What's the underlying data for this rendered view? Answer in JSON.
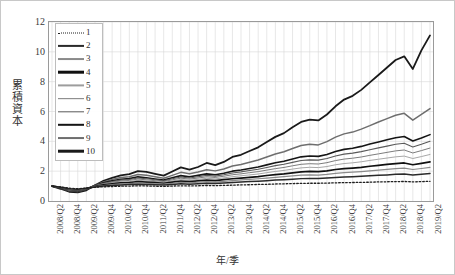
{
  "chart_data": {
    "type": "line",
    "title": "",
    "xlabel": "年/季",
    "ylabel": "累積資本",
    "ylim": [
      0,
      12
    ],
    "yticks": [
      0,
      2,
      4,
      6,
      8,
      10,
      12
    ],
    "grid": true,
    "legend_position": "top-left",
    "x_tick_labels": [
      "2008/Q2",
      "2008/Q4",
      "2009/Q2",
      "2009/Q4",
      "2010/Q2",
      "2010/Q4",
      "2011/Q2",
      "2011/Q4",
      "2012/Q2",
      "2012/Q4",
      "2013/Q2",
      "2013/Q4",
      "2014/Q2",
      "2014/Q4",
      "2015/Q2",
      "2015/Q4",
      "2016/Q2",
      "2016/Q4",
      "2017/Q2",
      "2017/Q4",
      "2018/Q2",
      "2018/Q4",
      "2019/Q2"
    ],
    "x": [
      "2008/Q2",
      "2008/Q3",
      "2008/Q4",
      "2009/Q1",
      "2009/Q2",
      "2009/Q3",
      "2009/Q4",
      "2010/Q1",
      "2010/Q2",
      "2010/Q3",
      "2010/Q4",
      "2011/Q1",
      "2011/Q2",
      "2011/Q3",
      "2011/Q4",
      "2012/Q1",
      "2012/Q2",
      "2012/Q3",
      "2012/Q4",
      "2013/Q1",
      "2013/Q2",
      "2013/Q3",
      "2013/Q4",
      "2014/Q1",
      "2014/Q2",
      "2014/Q3",
      "2014/Q4",
      "2015/Q1",
      "2015/Q2",
      "2015/Q3",
      "2015/Q4",
      "2016/Q1",
      "2016/Q2",
      "2016/Q3",
      "2016/Q4",
      "2017/Q1",
      "2017/Q2",
      "2017/Q3",
      "2017/Q4",
      "2018/Q1",
      "2018/Q2",
      "2018/Q3",
      "2018/Q4",
      "2019/Q1",
      "2019/Q2"
    ],
    "series": [
      {
        "name": "10",
        "style": "solid",
        "width": 1.8,
        "color": "#1a1a1a",
        "values": [
          1.0,
          0.82,
          0.62,
          0.58,
          0.72,
          1.05,
          1.35,
          1.55,
          1.72,
          1.8,
          2.0,
          1.95,
          1.82,
          1.7,
          1.98,
          2.25,
          2.1,
          2.28,
          2.55,
          2.4,
          2.62,
          2.95,
          3.1,
          3.35,
          3.6,
          3.95,
          4.3,
          4.55,
          4.95,
          5.3,
          5.45,
          5.4,
          5.8,
          6.35,
          6.8,
          7.05,
          7.45,
          7.95,
          8.45,
          8.95,
          9.45,
          9.7,
          8.85,
          10.1,
          11.1
        ]
      },
      {
        "name": "9",
        "style": "solid",
        "width": 1.5,
        "color": "#6e6e6e",
        "values": [
          1.0,
          0.85,
          0.68,
          0.64,
          0.78,
          1.05,
          1.28,
          1.45,
          1.58,
          1.62,
          1.78,
          1.72,
          1.62,
          1.52,
          1.72,
          1.92,
          1.82,
          1.95,
          2.1,
          2.02,
          2.15,
          2.35,
          2.45,
          2.6,
          2.75,
          2.95,
          3.15,
          3.3,
          3.52,
          3.72,
          3.8,
          3.76,
          3.98,
          4.28,
          4.5,
          4.62,
          4.82,
          5.05,
          5.3,
          5.52,
          5.75,
          5.88,
          5.42,
          5.8,
          6.2
        ]
      },
      {
        "name": "8",
        "style": "solid",
        "width": 1.6,
        "color": "#151515",
        "values": [
          1.0,
          0.86,
          0.7,
          0.66,
          0.8,
          1.04,
          1.22,
          1.36,
          1.46,
          1.5,
          1.62,
          1.56,
          1.48,
          1.4,
          1.56,
          1.7,
          1.62,
          1.72,
          1.82,
          1.76,
          1.86,
          2.0,
          2.08,
          2.18,
          2.28,
          2.42,
          2.56,
          2.66,
          2.82,
          2.96,
          3.02,
          2.99,
          3.12,
          3.32,
          3.46,
          3.54,
          3.66,
          3.82,
          3.96,
          4.1,
          4.24,
          4.32,
          4.02,
          4.22,
          4.45
        ]
      },
      {
        "name": "7",
        "style": "solid",
        "width": 1.1,
        "color": "#5a5a5a",
        "values": [
          1.0,
          0.87,
          0.71,
          0.67,
          0.81,
          1.03,
          1.19,
          1.31,
          1.4,
          1.44,
          1.54,
          1.49,
          1.42,
          1.35,
          1.49,
          1.61,
          1.54,
          1.63,
          1.72,
          1.67,
          1.76,
          1.88,
          1.95,
          2.04,
          2.13,
          2.25,
          2.37,
          2.46,
          2.59,
          2.71,
          2.76,
          2.74,
          2.85,
          3.02,
          3.14,
          3.21,
          3.31,
          3.44,
          3.56,
          3.68,
          3.8,
          3.87,
          3.62,
          3.8,
          4.0
        ]
      },
      {
        "name": "6",
        "style": "solid",
        "width": 1.0,
        "color": "#7c7c7c",
        "values": [
          1.0,
          0.88,
          0.73,
          0.69,
          0.82,
          1.02,
          1.16,
          1.26,
          1.34,
          1.38,
          1.47,
          1.42,
          1.36,
          1.3,
          1.42,
          1.53,
          1.47,
          1.54,
          1.62,
          1.58,
          1.66,
          1.76,
          1.82,
          1.9,
          1.97,
          2.07,
          2.17,
          2.25,
          2.36,
          2.46,
          2.5,
          2.48,
          2.57,
          2.71,
          2.81,
          2.87,
          2.95,
          3.06,
          3.16,
          3.26,
          3.36,
          3.42,
          3.22,
          3.38,
          3.55
        ]
      },
      {
        "name": "5",
        "style": "solid",
        "width": 0.9,
        "color": "#9d9d9d",
        "values": [
          1.0,
          0.89,
          0.75,
          0.71,
          0.83,
          1.0,
          1.12,
          1.21,
          1.28,
          1.31,
          1.39,
          1.35,
          1.3,
          1.25,
          1.35,
          1.44,
          1.39,
          1.45,
          1.52,
          1.48,
          1.55,
          1.63,
          1.69,
          1.75,
          1.81,
          1.9,
          1.98,
          2.05,
          2.14,
          2.22,
          2.26,
          2.24,
          2.31,
          2.43,
          2.51,
          2.56,
          2.63,
          2.72,
          2.8,
          2.88,
          2.96,
          3.01,
          2.85,
          2.98,
          3.12
        ]
      },
      {
        "name": "4",
        "style": "solid",
        "width": 1.7,
        "color": "#101010",
        "values": [
          1.0,
          0.9,
          0.77,
          0.73,
          0.84,
          0.98,
          1.08,
          1.15,
          1.21,
          1.24,
          1.3,
          1.27,
          1.23,
          1.19,
          1.27,
          1.34,
          1.3,
          1.35,
          1.4,
          1.37,
          1.43,
          1.49,
          1.54,
          1.59,
          1.64,
          1.71,
          1.77,
          1.82,
          1.89,
          1.95,
          1.98,
          1.97,
          2.02,
          2.11,
          2.17,
          2.21,
          2.26,
          2.33,
          2.39,
          2.45,
          2.51,
          2.55,
          2.43,
          2.52,
          2.62
        ]
      },
      {
        "name": "3",
        "style": "solid",
        "width": 1.2,
        "color": "#8a8a8a",
        "values": [
          1.0,
          0.91,
          0.79,
          0.75,
          0.85,
          0.96,
          1.04,
          1.1,
          1.15,
          1.17,
          1.22,
          1.19,
          1.16,
          1.13,
          1.19,
          1.25,
          1.22,
          1.26,
          1.3,
          1.27,
          1.32,
          1.37,
          1.41,
          1.45,
          1.49,
          1.54,
          1.59,
          1.63,
          1.68,
          1.73,
          1.75,
          1.74,
          1.78,
          1.85,
          1.9,
          1.93,
          1.97,
          2.02,
          2.07,
          2.12,
          2.17,
          2.2,
          2.11,
          2.18,
          2.26
        ]
      },
      {
        "name": "2",
        "style": "solid",
        "width": 1.5,
        "color": "#2a2a2a",
        "values": [
          1.0,
          0.92,
          0.82,
          0.78,
          0.86,
          0.94,
          1.0,
          1.04,
          1.08,
          1.1,
          1.13,
          1.11,
          1.09,
          1.07,
          1.11,
          1.15,
          1.13,
          1.16,
          1.19,
          1.17,
          1.2,
          1.24,
          1.27,
          1.3,
          1.33,
          1.36,
          1.4,
          1.43,
          1.46,
          1.5,
          1.51,
          1.51,
          1.54,
          1.58,
          1.61,
          1.63,
          1.66,
          1.69,
          1.72,
          1.75,
          1.79,
          1.81,
          1.75,
          1.8,
          1.85
        ]
      },
      {
        "name": "1",
        "style": "dotted",
        "width": 1.3,
        "color": "#1f1f1f",
        "values": [
          1.0,
          0.94,
          0.86,
          0.82,
          0.87,
          0.92,
          0.95,
          0.97,
          0.99,
          1.0,
          1.02,
          1.01,
          0.99,
          0.98,
          1.0,
          1.02,
          1.01,
          1.02,
          1.04,
          1.03,
          1.05,
          1.06,
          1.08,
          1.09,
          1.11,
          1.12,
          1.14,
          1.15,
          1.17,
          1.18,
          1.19,
          1.19,
          1.2,
          1.22,
          1.23,
          1.24,
          1.25,
          1.26,
          1.28,
          1.29,
          1.3,
          1.31,
          1.28,
          1.3,
          1.32
        ]
      }
    ],
    "legend": [
      {
        "label": "1",
        "style": "dotted",
        "width": 1.3,
        "color": "#1f1f1f"
      },
      {
        "label": "2",
        "style": "solid",
        "width": 2.2,
        "color": "#2a2a2a"
      },
      {
        "label": "3",
        "style": "solid",
        "width": 1.9,
        "color": "#8a8a8a"
      },
      {
        "label": "4",
        "style": "solid",
        "width": 2.6,
        "color": "#101010"
      },
      {
        "label": "5",
        "style": "solid",
        "width": 1.2,
        "color": "#9d9d9d"
      },
      {
        "label": "6",
        "style": "solid",
        "width": 1.7,
        "color": "#7c7c7c"
      },
      {
        "label": "7",
        "style": "solid",
        "width": 1.4,
        "color": "#5a5a5a"
      },
      {
        "label": "8",
        "style": "solid",
        "width": 2.4,
        "color": "#151515"
      },
      {
        "label": "9",
        "style": "solid",
        "width": 1.9,
        "color": "#6e6e6e"
      },
      {
        "label": "10",
        "style": "solid",
        "width": 2.6,
        "color": "#1a1a1a"
      }
    ]
  }
}
